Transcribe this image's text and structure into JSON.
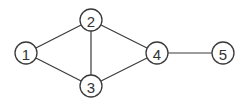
{
  "graph": {
    "node_radius": 11,
    "nodes": [
      {
        "id": "1",
        "label": "1",
        "x": 26,
        "y": 53
      },
      {
        "id": "2",
        "label": "2",
        "x": 91,
        "y": 20
      },
      {
        "id": "3",
        "label": "3",
        "x": 91,
        "y": 86
      },
      {
        "id": "4",
        "label": "4",
        "x": 157,
        "y": 53
      },
      {
        "id": "5",
        "label": "5",
        "x": 223,
        "y": 53
      }
    ],
    "edges": [
      {
        "from": "1",
        "to": "2"
      },
      {
        "from": "1",
        "to": "3"
      },
      {
        "from": "2",
        "to": "3"
      },
      {
        "from": "2",
        "to": "4"
      },
      {
        "from": "3",
        "to": "4"
      },
      {
        "from": "4",
        "to": "5"
      }
    ],
    "colors": {
      "stroke": "#3a3a3a",
      "fill": "#ffffff",
      "text": "#333333"
    }
  }
}
